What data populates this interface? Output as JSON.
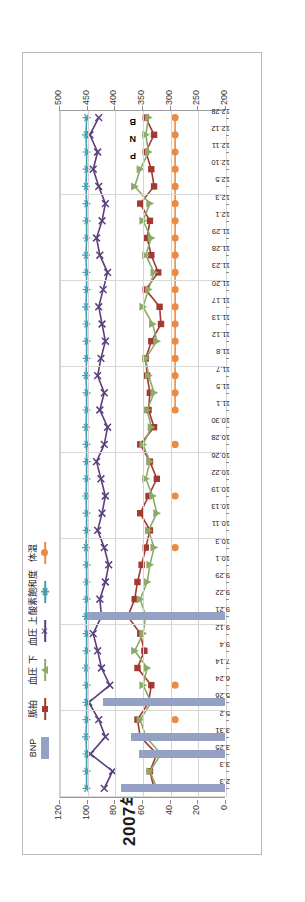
{
  "chart_data": {
    "type": "line",
    "title": "2007年",
    "orientation": "rotated-90-ccw",
    "xlabel": "",
    "ylabel_left": "",
    "ylabel_right": "",
    "grid": true,
    "legend_position": "top",
    "axis_left": {
      "ticks": [
        0,
        20,
        40,
        60,
        80,
        100,
        120
      ],
      "tick_labels": [
        "0",
        "20",
        "40",
        "60",
        "80",
        "100",
        "120"
      ],
      "ylim": [
        0,
        120
      ]
    },
    "axis_right": {
      "ticks": [
        200,
        250,
        300,
        350,
        400,
        450,
        500
      ],
      "tick_labels": [
        "200",
        "250",
        "300",
        "350",
        "400",
        "450",
        "500"
      ],
      "ylim": [
        200,
        500
      ]
    },
    "categories": [
      "2.3",
      "3.3",
      "3.25",
      "3.31",
      "5.2",
      "5.26",
      "6.24",
      "7.14",
      "9.4",
      "9.12",
      "9.21",
      "9.22",
      "9.29",
      "10.1",
      "10.3",
      "10.11",
      "10.13",
      "10.19",
      "10.22",
      "10.26",
      "10.28",
      "10.30",
      "11.1",
      "11.5",
      "11.7",
      "11.8",
      "11.12",
      "11.13",
      "11.17",
      "11.20",
      "11.23",
      "11.28",
      "11.29",
      "12.1",
      "12.3",
      "12.5",
      "12.10",
      "12.11",
      "12.12",
      "12.28"
    ],
    "annotations": [
      {
        "text": "B",
        "near": "12.28"
      },
      {
        "text": "N",
        "near": "12.28"
      },
      {
        "text": "P",
        "near": "12.28"
      }
    ],
    "series": [
      {
        "name": "BNP",
        "type": "bar",
        "color": "#94a0c4",
        "axis": "left",
        "values": [
          75,
          null,
          62,
          68,
          null,
          88,
          null,
          null,
          null,
          null,
          100,
          null,
          null,
          null,
          null,
          null,
          null,
          null,
          null,
          null,
          null,
          null,
          null,
          null,
          null,
          null,
          null,
          null,
          null,
          null,
          null,
          null,
          null,
          null,
          null,
          null,
          null,
          null,
          null,
          null
        ]
      },
      {
        "name": "脈拍",
        "type": "line",
        "color": "#a33a31",
        "marker": "square",
        "axis": "left",
        "values": [
          52,
          55,
          50,
          62,
          64,
          56,
          54,
          64,
          59,
          62,
          71,
          66,
          64,
          61,
          58,
          55,
          62,
          56,
          50,
          55,
          62,
          52,
          56,
          55,
          57,
          58,
          54,
          47,
          48,
          58,
          49,
          54,
          57,
          55,
          62,
          52,
          54,
          58,
          52,
          58
        ]
      },
      {
        "name": "血圧 下",
        "type": "line",
        "color": "#8cab68",
        "marker": "triangle",
        "axis": "left",
        "values": [
          50,
          55,
          47,
          58,
          62,
          54,
          60,
          57,
          66,
          60,
          58,
          62,
          57,
          55,
          52,
          56,
          50,
          53,
          58,
          55,
          60,
          54,
          57,
          52,
          56,
          58,
          50,
          53,
          60,
          56,
          52,
          58,
          54,
          60,
          55,
          66,
          62,
          56,
          58,
          56
        ]
      },
      {
        "name": "血圧 上",
        "type": "line",
        "color": "#5b3f7a",
        "marker": "x",
        "axis": "right",
        "values": [
          420,
          405,
          445,
          418,
          430,
          448,
          410,
          425,
          432,
          440,
          425,
          428,
          418,
          412,
          420,
          432,
          424,
          418,
          426,
          434,
          420,
          414,
          428,
          420,
          432,
          426,
          418,
          424,
          430,
          422,
          414,
          428,
          434,
          424,
          418,
          430,
          440,
          432,
          446,
          430
        ]
      },
      {
        "name": "酸素飽和度",
        "type": "line",
        "color": "#3f9fb0",
        "marker": "asterisk",
        "axis": "right",
        "values": [
          452,
          452,
          452,
          453,
          452,
          452,
          452,
          453,
          452,
          452,
          453,
          452,
          452,
          452,
          453,
          452,
          452,
          453,
          452,
          452,
          452,
          453,
          452,
          452,
          453,
          452,
          452,
          452,
          453,
          452,
          452,
          453,
          452,
          452,
          452,
          453,
          452,
          452,
          453,
          452
        ]
      },
      {
        "name": "体温",
        "type": "line",
        "color": "#eb8a45",
        "marker": "circle",
        "axis": "right",
        "values": [
          null,
          null,
          null,
          null,
          292,
          null,
          292,
          null,
          null,
          null,
          292,
          null,
          null,
          null,
          292,
          null,
          null,
          292,
          null,
          null,
          292,
          null,
          292,
          292,
          292,
          292,
          292,
          292,
          292,
          292,
          292,
          292,
          292,
          292,
          292,
          292,
          292,
          292,
          292,
          292
        ]
      }
    ],
    "legend": [
      {
        "label": "BNP",
        "color": "#94a0c4",
        "marker": "bar"
      },
      {
        "label": "脈拍",
        "color": "#a33a31",
        "marker": "square"
      },
      {
        "label": "血圧 下",
        "color": "#8cab68",
        "marker": "triangle"
      },
      {
        "label": "血圧 上",
        "color": "#5b3f7a",
        "marker": "x"
      },
      {
        "label": "酸素飽和度",
        "color": "#3f9fb0",
        "marker": "asterisk"
      },
      {
        "label": "体温",
        "color": "#eb8a45",
        "marker": "circle"
      }
    ]
  }
}
